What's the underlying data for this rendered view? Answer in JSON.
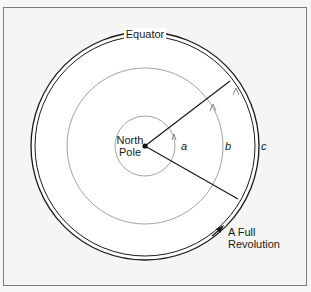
{
  "diagram": {
    "type": "concentric-circles",
    "title": "",
    "labels": {
      "equator": "Equator",
      "north_pole_line1": "North",
      "north_pole_line2": "Pole",
      "arc_a": "a",
      "arc_b": "b",
      "arc_c": "c",
      "revolution_line1": "A Full",
      "revolution_line2": "Revolution"
    },
    "colors": {
      "background": "#f5f5f5",
      "disk_fill": "#ffffff",
      "line_dark": "#1a1a1a",
      "line_light": "#808080",
      "frame": "#7d7d7d"
    }
  }
}
